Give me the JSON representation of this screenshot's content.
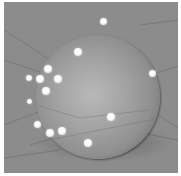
{
  "scene": {
    "description": "3D render of a grey sphere covered with white glowing dots, resting on a grey floor with faint grid lines",
    "colors": {
      "background": "#8c8c8c",
      "sphere_highlight": "#b9b9b9",
      "sphere_edge": "#3a3a3a",
      "dot": "#ffffff",
      "border": "#ffffff"
    },
    "sphere": {
      "cx": 98,
      "cy": 97,
      "r": 62
    },
    "dots": [
      {
        "x": 103,
        "y": 21,
        "r": 3.5
      },
      {
        "x": 78,
        "y": 52,
        "r": 4
      },
      {
        "x": 48,
        "y": 69,
        "r": 4
      },
      {
        "x": 40,
        "y": 79,
        "r": 4
      },
      {
        "x": 58,
        "y": 79,
        "r": 4
      },
      {
        "x": 29,
        "y": 78,
        "r": 3
      },
      {
        "x": 46,
        "y": 91,
        "r": 4
      },
      {
        "x": 29,
        "y": 101,
        "r": 2.5
      },
      {
        "x": 152,
        "y": 73,
        "r": 3.5
      },
      {
        "x": 111,
        "y": 117,
        "r": 4
      },
      {
        "x": 37,
        "y": 124,
        "r": 3.5
      },
      {
        "x": 50,
        "y": 133,
        "r": 4
      },
      {
        "x": 62,
        "y": 131,
        "r": 4
      },
      {
        "x": 88,
        "y": 143,
        "r": 4
      }
    ]
  }
}
